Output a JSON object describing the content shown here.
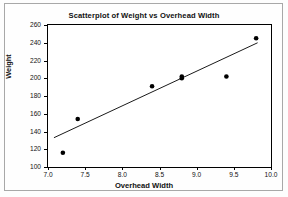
{
  "chart_data": {
    "type": "scatter",
    "title": "Scatterplot of Weight vs Overhead Width",
    "xlabel": "Overhead Width",
    "ylabel": "Weight",
    "xlim": [
      7.0,
      10.0
    ],
    "ylim": [
      100,
      260
    ],
    "xticks": [
      "7.0",
      "7.5",
      "8.0",
      "8.5",
      "9.0",
      "9.5",
      "10.0"
    ],
    "xtick_values": [
      7.0,
      7.5,
      8.0,
      8.5,
      9.0,
      9.5,
      10.0
    ],
    "yticks": [
      "100",
      "120",
      "140",
      "160",
      "180",
      "200",
      "220",
      "240",
      "260"
    ],
    "ytick_values": [
      100,
      120,
      140,
      160,
      180,
      200,
      220,
      240,
      260
    ],
    "grid": false,
    "legend": false,
    "marker": "filled-circle",
    "marker_color": "#000000",
    "points": [
      {
        "x": 7.2,
        "y": 116
      },
      {
        "x": 7.4,
        "y": 154
      },
      {
        "x": 8.4,
        "y": 191
      },
      {
        "x": 8.8,
        "y": 200
      },
      {
        "x": 8.8,
        "y": 202
      },
      {
        "x": 9.4,
        "y": 202
      },
      {
        "x": 9.8,
        "y": 245
      }
    ],
    "trend_line": {
      "type": "linear-fit",
      "color": "#000000",
      "x_start": 7.08,
      "y_start": 133,
      "x_end": 9.82,
      "y_end": 240
    }
  },
  "colors": {
    "axis": "#000000",
    "text": "#111111",
    "plot_background": "#ffffff",
    "page_background": "#fefefe",
    "page_border": "#a8a8a8"
  }
}
